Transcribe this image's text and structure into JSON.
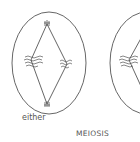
{
  "diagram": {
    "labels": {
      "left_cell": "either",
      "process": "MEIOSIS"
    },
    "colors": {
      "line": "#555555",
      "background": "#ffffff",
      "text": "#555555"
    },
    "cells": [
      {
        "name": "left-cell",
        "cx": 49,
        "cy": 63,
        "rx": 37,
        "ry": 51
      },
      {
        "name": "right-cell",
        "cx": 147,
        "cy": 63,
        "rx": 37,
        "ry": 51
      }
    ]
  }
}
